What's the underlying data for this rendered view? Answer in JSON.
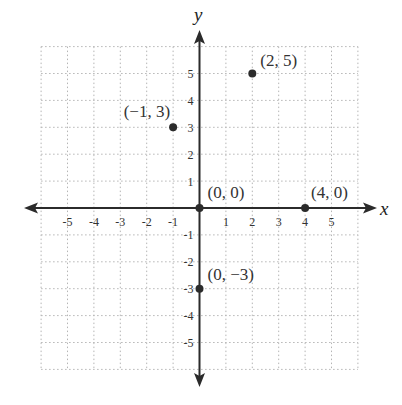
{
  "chart_data": {
    "type": "scatter",
    "title": "",
    "xlabel": "x",
    "ylabel": "y",
    "xlim": [
      -6,
      6
    ],
    "ylim": [
      -6,
      6
    ],
    "grid": true,
    "grid_style": "dotted",
    "x_ticks": [
      "-5",
      "-4",
      "-3",
      "-2",
      "-1",
      "1",
      "2",
      "3",
      "4",
      "5"
    ],
    "y_ticks": [
      "5",
      "4",
      "3",
      "2",
      "1",
      "-1",
      "-2",
      "-3",
      "-4",
      "-5"
    ],
    "points": [
      {
        "x": 2,
        "y": 5,
        "label": "(2, 5)"
      },
      {
        "x": -1,
        "y": 3,
        "label": "(−1, 3)"
      },
      {
        "x": 0,
        "y": 0,
        "label": "(0, 0)"
      },
      {
        "x": 4,
        "y": 0,
        "label": "(4, 0)"
      },
      {
        "x": 0,
        "y": -3,
        "label": "(0, −3)"
      }
    ],
    "colors": {
      "axis": "#2b2b2b",
      "grid": "#b5b5b5",
      "point": "#2b2b2b",
      "text": "#333333"
    }
  }
}
